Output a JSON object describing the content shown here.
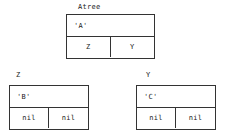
{
  "diagram": {
    "colors": {
      "border": "#333333",
      "background": "#ffffff",
      "text": "#1a1a1a"
    },
    "nodes": [
      {
        "id": "root",
        "label": "Atree",
        "value": "'A'",
        "left_pointer": "Z",
        "right_pointer": "Y"
      },
      {
        "id": "left",
        "label": "Z",
        "value": "'B'",
        "left_pointer": "nil",
        "right_pointer": "nil"
      },
      {
        "id": "right",
        "label": "Y",
        "value": "'C'",
        "left_pointer": "nil",
        "right_pointer": "nil"
      }
    ]
  }
}
